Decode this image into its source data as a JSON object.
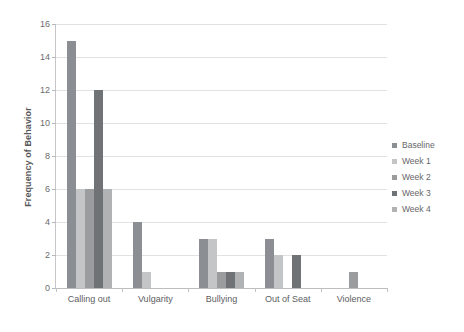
{
  "chart_data": {
    "type": "bar",
    "title": "",
    "xlabel": "",
    "ylabel": "Frequency of Behavior",
    "ylim": [
      0,
      16
    ],
    "yticks": [
      0,
      2,
      4,
      6,
      8,
      10,
      12,
      14,
      16
    ],
    "grid": true,
    "legend_position": "right",
    "categories": [
      "Calling out",
      "Vulgarity",
      "Bullying",
      "Out of Seat",
      "Violence"
    ],
    "series": [
      {
        "name": "Baseline",
        "color": "#8b8e92",
        "values": [
          15,
          4,
          3,
          3,
          0
        ]
      },
      {
        "name": "Week 1",
        "color": "#c3c5c7",
        "values": [
          6,
          1,
          3,
          2,
          0
        ]
      },
      {
        "name": "Week 2",
        "color": "#9a9c9e",
        "values": [
          6,
          0,
          1,
          0,
          1
        ]
      },
      {
        "name": "Week 3",
        "color": "#6f7376",
        "values": [
          12,
          0,
          1,
          2,
          0
        ]
      },
      {
        "name": "Week 4",
        "color": "#b0b2b4",
        "values": [
          6,
          0,
          1,
          0,
          0
        ]
      }
    ]
  }
}
